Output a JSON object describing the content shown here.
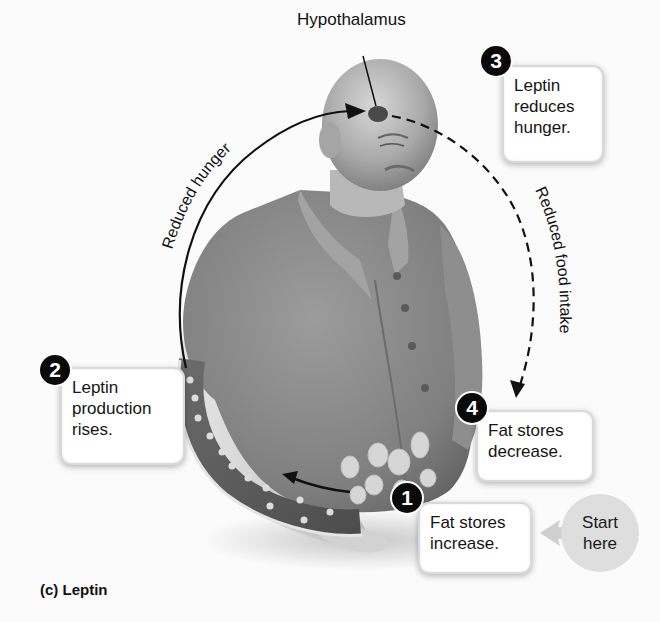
{
  "figure": {
    "caption": "(c) Leptin",
    "hypothalamus_label": "Hypothalamus",
    "arrows": {
      "left_arc_label": "Reduced hunger",
      "right_arc_label": "Reduced food intake"
    },
    "start_marker": {
      "line1": "Start",
      "line2": "here"
    },
    "steps": [
      {
        "number": "1",
        "lines": [
          "Fat stores",
          "increase."
        ]
      },
      {
        "number": "2",
        "lines": [
          "Leptin",
          "production",
          "rises."
        ]
      },
      {
        "number": "3",
        "lines": [
          "Leptin",
          "reduces",
          "hunger."
        ]
      },
      {
        "number": "4",
        "lines": [
          "Fat stores",
          "decrease."
        ]
      }
    ]
  },
  "colors": {
    "background": "#fbfbfb",
    "badge": "#0a0a0a",
    "start_circle": "#dedede",
    "figure_gray": "#8a8a8a"
  }
}
